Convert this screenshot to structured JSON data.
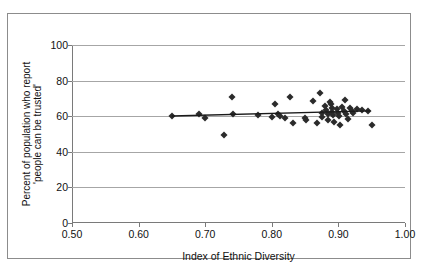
{
  "chart_data": {
    "type": "scatter",
    "title": "",
    "xlabel": "Index of Ethnic Diversity",
    "ylabel": "Percent of population who report 'people can be trusted'",
    "ylabel_line1": "Percent of population who report",
    "ylabel_line2": "'people can be trusted'",
    "xlim": [
      0.5,
      1.0
    ],
    "ylim": [
      0,
      100
    ],
    "xticks": [
      0.5,
      0.6,
      0.7,
      0.8,
      0.9,
      1.0
    ],
    "xtick_labels": [
      "0.50",
      "0.60",
      "0.70",
      "0.80",
      "0.90",
      "1.00"
    ],
    "yticks": [
      0,
      20,
      40,
      60,
      80,
      100
    ],
    "ytick_labels": [
      "0",
      "20",
      "40",
      "60",
      "80",
      "100"
    ],
    "grid": "horizontal",
    "legend": "none",
    "marker": "diamond",
    "marker_color": "#2b2b2b",
    "points": [
      {
        "x": 0.65,
        "y": 60.0
      },
      {
        "x": 0.69,
        "y": 61.3
      },
      {
        "x": 0.7,
        "y": 58.8
      },
      {
        "x": 0.728,
        "y": 49.3
      },
      {
        "x": 0.74,
        "y": 71.0
      },
      {
        "x": 0.742,
        "y": 61.5
      },
      {
        "x": 0.78,
        "y": 60.5
      },
      {
        "x": 0.8,
        "y": 59.8
      },
      {
        "x": 0.805,
        "y": 67.0
      },
      {
        "x": 0.81,
        "y": 61.3
      },
      {
        "x": 0.812,
        "y": 60.3
      },
      {
        "x": 0.82,
        "y": 59.0
      },
      {
        "x": 0.828,
        "y": 71.0
      },
      {
        "x": 0.832,
        "y": 56.2
      },
      {
        "x": 0.85,
        "y": 59.2
      },
      {
        "x": 0.852,
        "y": 57.7
      },
      {
        "x": 0.862,
        "y": 68.5
      },
      {
        "x": 0.868,
        "y": 56.2
      },
      {
        "x": 0.872,
        "y": 73.0
      },
      {
        "x": 0.875,
        "y": 62.0
      },
      {
        "x": 0.876,
        "y": 59.5
      },
      {
        "x": 0.88,
        "y": 66.0
      },
      {
        "x": 0.882,
        "y": 63.5
      },
      {
        "x": 0.884,
        "y": 61.0
      },
      {
        "x": 0.885,
        "y": 58.0
      },
      {
        "x": 0.888,
        "y": 68.0
      },
      {
        "x": 0.889,
        "y": 66.8
      },
      {
        "x": 0.89,
        "y": 64.5
      },
      {
        "x": 0.891,
        "y": 62.5
      },
      {
        "x": 0.892,
        "y": 60.5
      },
      {
        "x": 0.894,
        "y": 57.0
      },
      {
        "x": 0.898,
        "y": 64.0
      },
      {
        "x": 0.9,
        "y": 62.0
      },
      {
        "x": 0.901,
        "y": 60.0
      },
      {
        "x": 0.903,
        "y": 54.8
      },
      {
        "x": 0.905,
        "y": 65.0
      },
      {
        "x": 0.908,
        "y": 63.0
      },
      {
        "x": 0.91,
        "y": 69.0
      },
      {
        "x": 0.912,
        "y": 61.5
      },
      {
        "x": 0.914,
        "y": 58.2
      },
      {
        "x": 0.918,
        "y": 64.5
      },
      {
        "x": 0.92,
        "y": 62.8
      },
      {
        "x": 0.922,
        "y": 62.0
      },
      {
        "x": 0.928,
        "y": 63.8
      },
      {
        "x": 0.935,
        "y": 63.5
      },
      {
        "x": 0.945,
        "y": 63.2
      },
      {
        "x": 0.95,
        "y": 55.3
      }
    ],
    "trendline": {
      "type": "linear",
      "x_start": 0.65,
      "y_start": 60.1,
      "x_end": 0.948,
      "y_end": 63.0,
      "color": "#1a1a1a"
    }
  }
}
